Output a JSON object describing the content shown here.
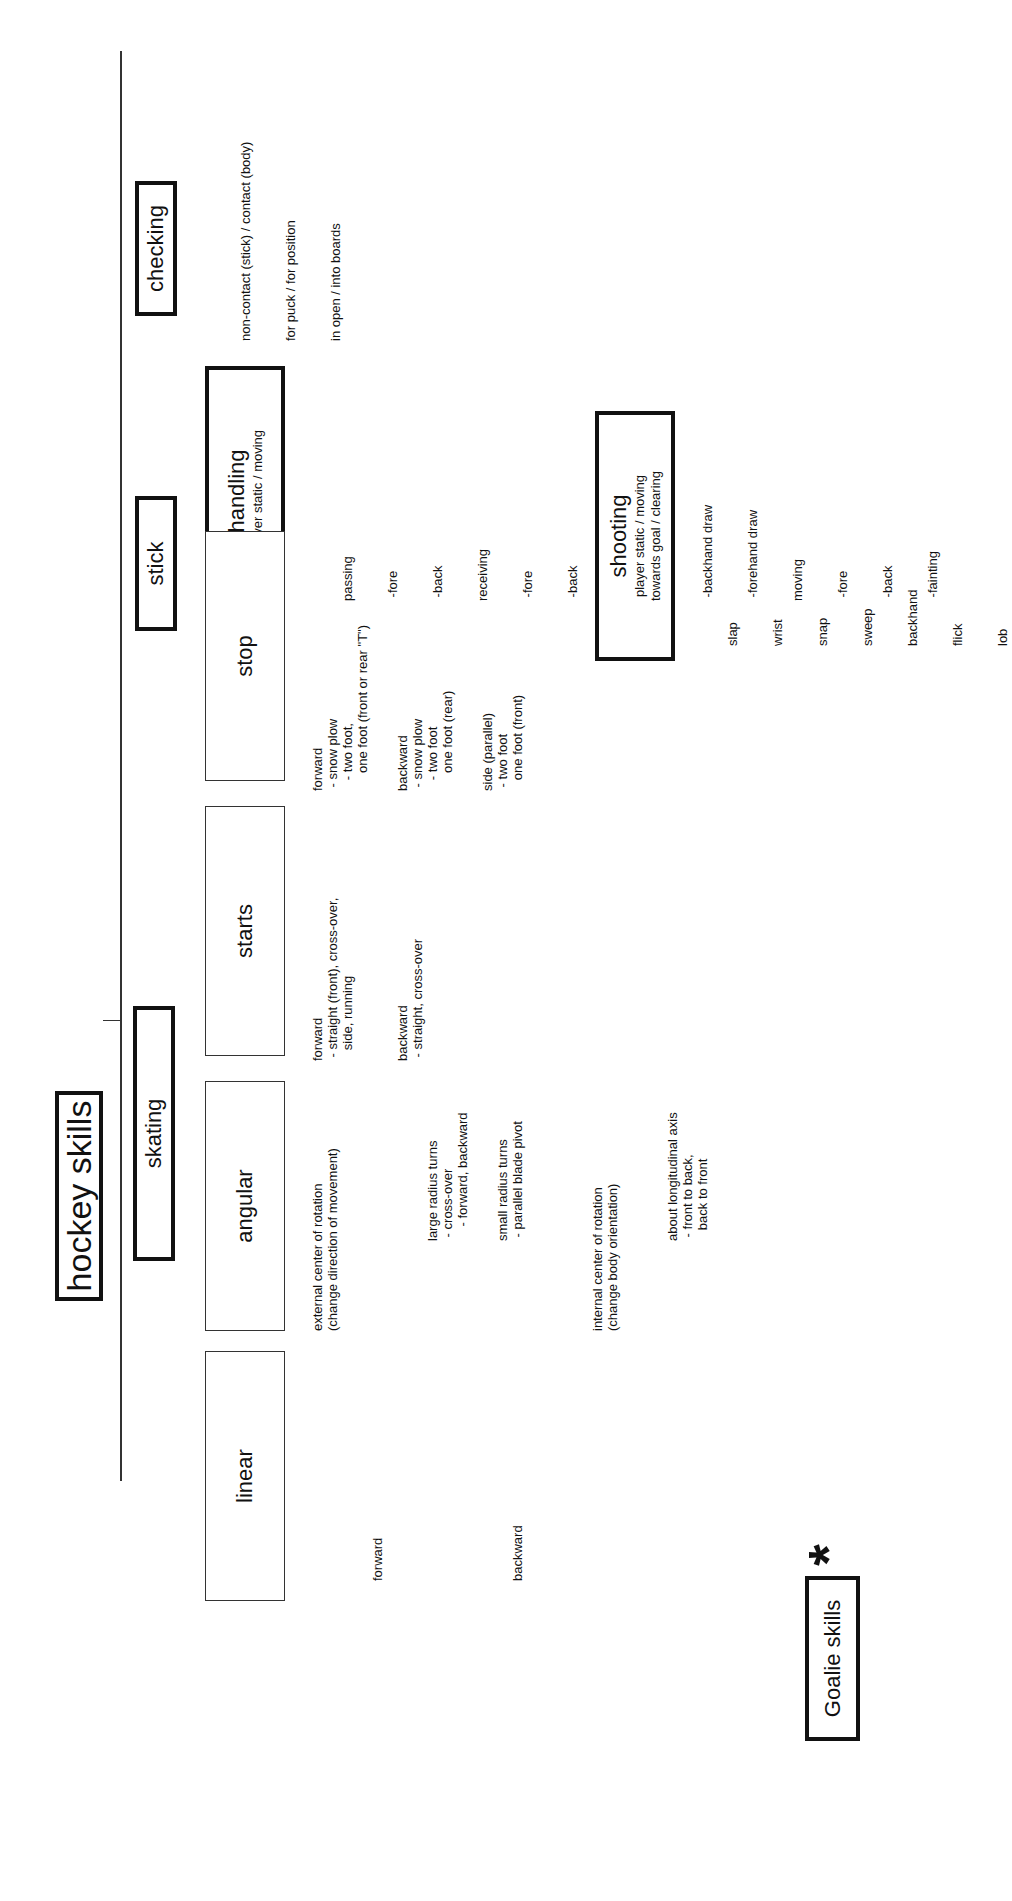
{
  "layout_note": "Positions are approximate, reconstructed from overall proportions; all text content was read directly from the source.",
  "root": {
    "label": "hockey skills"
  },
  "categories": {
    "checking": {
      "label": "checking",
      "items": [
        "non-contact (stick) / contact (body)",
        "for puck / for position",
        "in open / into boards"
      ]
    },
    "stick": {
      "label": "stick",
      "handling": {
        "label": "handling",
        "subtitle": "player static / moving",
        "items": [
          "passing",
          " -fore",
          " -back",
          "receiving",
          " -fore",
          " -back",
          "faceoff",
          " -block",
          " -backhand draw",
          " -forehand draw",
          "moving",
          " -fore",
          " -back",
          " -fainting"
        ]
      },
      "shooting": {
        "label": "shooting",
        "subtitle1": "player static / moving",
        "subtitle2": "towards goal / clearing",
        "items": [
          "slap",
          "wrist",
          "snap",
          "sweep",
          "backhand",
          "flick",
          "lob"
        ]
      }
    },
    "skating": {
      "label": "skating",
      "stop": {
        "label": "stop",
        "groups": [
          "forward\n - snow plow\n   - two foot,\n     one foot (front or rear \"T\")",
          "backward\n - snow plow\n   - two foot\n     one foot (rear)",
          "side (parallel)\n - two foot\n   one foot (front)"
        ]
      },
      "starts": {
        "label": "starts",
        "groups": [
          "forward\n - straight (front), cross-over,\n   side, running",
          "backward\n - straight, cross-over"
        ]
      },
      "angular": {
        "label": "angular",
        "external": "external center of rotation\n(change direction of movement)",
        "external_groups": [
          "large radius turns\n - cross-over\n    - forward, backward",
          "small radius turns\n - parallel blade pivot"
        ],
        "internal": "internal center of rotation\n(change body orientation)",
        "internal_groups": [
          "about longitudinal axis\n - front to back,\n   back to front"
        ]
      },
      "linear": {
        "label": "linear",
        "items": [
          "forward",
          "backward"
        ]
      }
    }
  },
  "goalie": {
    "label": "Goalie skills",
    "marker": "*"
  }
}
